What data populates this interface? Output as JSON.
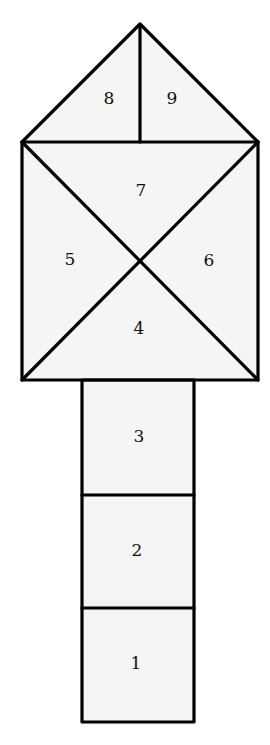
{
  "diagram": {
    "title": "",
    "colors": {
      "fill": "#f5f5f5",
      "stroke": "#000000",
      "text": "#111111"
    },
    "cells": [
      {
        "id": 1,
        "label": "1",
        "shape": "square",
        "section": "column"
      },
      {
        "id": 2,
        "label": "2",
        "shape": "square",
        "section": "column"
      },
      {
        "id": 3,
        "label": "3",
        "shape": "square",
        "section": "column"
      },
      {
        "id": 4,
        "label": "4",
        "shape": "triangle",
        "section": "crossed-square",
        "position": "bottom"
      },
      {
        "id": 5,
        "label": "5",
        "shape": "triangle",
        "section": "crossed-square",
        "position": "left"
      },
      {
        "id": 6,
        "label": "6",
        "shape": "triangle",
        "section": "crossed-square",
        "position": "right"
      },
      {
        "id": 7,
        "label": "7",
        "shape": "triangle",
        "section": "crossed-square",
        "position": "top"
      },
      {
        "id": 8,
        "label": "8",
        "shape": "right-triangle",
        "section": "roof",
        "position": "left"
      },
      {
        "id": 9,
        "label": "9",
        "shape": "right-triangle",
        "section": "roof",
        "position": "right"
      }
    ]
  }
}
